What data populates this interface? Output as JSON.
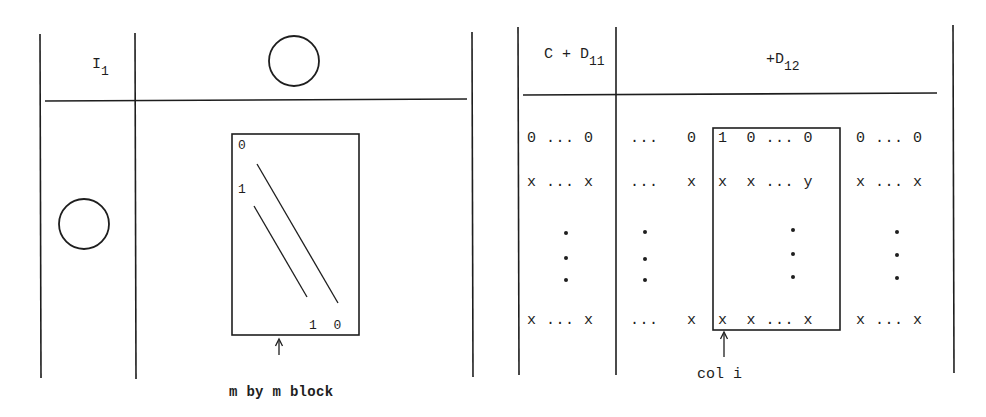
{
  "left_diagram": {
    "header_left": {
      "symbol": "I",
      "subscript": "1"
    },
    "top_right_symbol": "zero-block-circle",
    "bottom_left_symbol": "zero-block-circle",
    "inner_block": {
      "top_left_label": "0",
      "second_row_label": "1",
      "bottom_right_labels": "1 0"
    },
    "caption": "m by m block"
  },
  "right_diagram": {
    "header_left": {
      "prefix": "C + D",
      "subscript": "11"
    },
    "header_right": {
      "prefix": "+D",
      "subscript": "12"
    },
    "rows": {
      "row1": {
        "col_a": "0 ... 0",
        "col_b": "...   0",
        "col_c": "1  0 ... 0",
        "col_d": "0 ... 0"
      },
      "row2": {
        "col_a": "x ... x",
        "col_b": "...   x",
        "col_c": "x  x ... y",
        "col_d": "x ... x"
      },
      "row_last": {
        "col_a": "x ... x",
        "col_b": "...   x",
        "col_c": "x  x ... x",
        "col_d": "x ... x"
      }
    },
    "caption": "col i"
  }
}
